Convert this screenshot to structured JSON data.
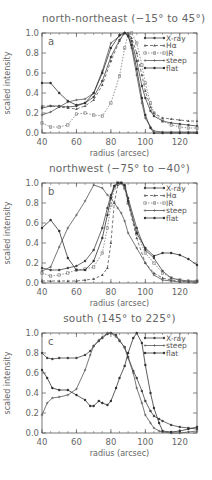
{
  "chart_data": [
    {
      "type": "line",
      "panel_label": "a",
      "title": "north-northeast (−15° to 45°)",
      "xlabel": "radius (arcsec)",
      "ylabel": "scaled intensity",
      "xlim": [
        40,
        130
      ],
      "ylim": [
        0,
        1.0
      ],
      "xticks": [
        40,
        60,
        80,
        100,
        120
      ],
      "yticks": [
        0.0,
        0.2,
        0.4,
        0.6,
        0.8,
        1.0
      ],
      "grid": false,
      "legend_position": "upper right",
      "x": [
        40,
        45,
        50,
        55,
        60,
        65,
        70,
        75,
        80,
        85,
        88,
        90,
        92,
        95,
        98,
        100,
        103,
        105,
        110,
        115,
        120,
        125,
        130
      ],
      "series": [
        {
          "name": "X-ray",
          "marker": "filled-circle",
          "values": [
            0.25,
            0.27,
            0.27,
            0.26,
            0.27,
            0.3,
            0.36,
            0.52,
            0.76,
            0.93,
            1.0,
            0.99,
            0.92,
            0.72,
            0.47,
            0.35,
            0.22,
            0.17,
            0.12,
            0.1,
            0.09,
            0.08,
            0.07
          ]
        },
        {
          "name": "Hα",
          "marker": "triangle",
          "values": [
            0.27,
            0.27,
            0.26,
            0.25,
            0.24,
            0.27,
            0.33,
            0.48,
            0.72,
            0.92,
            1.0,
            1.0,
            0.95,
            0.8,
            0.58,
            0.42,
            0.26,
            0.2,
            0.15,
            0.14,
            0.13,
            0.12,
            0.12
          ]
        },
        {
          "name": "IR",
          "marker": "open-square",
          "values": [
            0.1,
            0.06,
            0.06,
            0.08,
            0.19,
            0.2,
            0.18,
            0.17,
            0.3,
            0.57,
            0.85,
            0.99,
            1.0,
            0.9,
            0.68,
            0.5,
            0.3,
            0.2,
            0.12,
            0.08,
            0.06,
            0.05,
            0.05
          ]
        },
        {
          "name": "steep",
          "marker": "plus",
          "values": [
            0.18,
            0.21,
            0.26,
            0.31,
            0.33,
            0.34,
            0.4,
            0.62,
            0.9,
            0.97,
            1.0,
            0.97,
            0.85,
            0.58,
            0.3,
            0.15,
            0.06,
            0.02,
            0.01,
            0.01,
            0.01,
            0.01,
            0.01
          ]
        },
        {
          "name": "flat",
          "marker": "filled-circle",
          "values": [
            0.5,
            0.5,
            0.4,
            0.32,
            0.28,
            0.3,
            0.4,
            0.6,
            0.85,
            0.98,
            1.0,
            0.97,
            0.88,
            0.64,
            0.35,
            0.18,
            0.05,
            0.0,
            0.0,
            0.0,
            0.0,
            0.0,
            0.0
          ]
        }
      ]
    },
    {
      "type": "line",
      "panel_label": "b",
      "title": "northwest (−75° to −40°)",
      "xlabel": "radius (arcsec)",
      "ylabel": "scaled intensity",
      "xlim": [
        40,
        130
      ],
      "ylim": [
        0,
        1.0
      ],
      "xticks": [
        40,
        60,
        80,
        100,
        120
      ],
      "yticks": [
        0.0,
        0.2,
        0.4,
        0.6,
        0.8,
        1.0
      ],
      "grid": false,
      "legend_position": "upper right",
      "x": [
        40,
        45,
        50,
        55,
        60,
        65,
        70,
        75,
        78,
        80,
        82,
        84,
        86,
        88,
        90,
        95,
        100,
        105,
        110,
        115,
        120,
        125,
        130
      ],
      "series": [
        {
          "name": "X-ray",
          "marker": "filled-circle",
          "values": [
            0.15,
            0.13,
            0.13,
            0.15,
            0.17,
            0.22,
            0.33,
            0.55,
            0.75,
            0.88,
            0.97,
            1.0,
            1.0,
            0.97,
            0.85,
            0.55,
            0.33,
            0.25,
            0.12,
            0.05,
            0.03,
            0.02,
            0.02
          ]
        },
        {
          "name": "Hα",
          "marker": "triangle",
          "values": [
            0.02,
            0.02,
            0.02,
            0.02,
            0.02,
            0.03,
            0.04,
            0.08,
            0.15,
            0.4,
            0.8,
            0.98,
            1.0,
            0.95,
            0.8,
            0.45,
            0.2,
            0.1,
            0.05,
            0.03,
            0.02,
            0.01,
            0.01
          ]
        },
        {
          "name": "IR",
          "marker": "open-square",
          "values": [
            0.1,
            0.07,
            0.08,
            0.1,
            0.13,
            0.14,
            0.16,
            0.3,
            0.55,
            0.78,
            0.95,
            1.0,
            1.0,
            0.95,
            0.8,
            0.5,
            0.3,
            0.2,
            0.1,
            0.05,
            0.03,
            0.02,
            0.02
          ]
        },
        {
          "name": "steep",
          "marker": "plus",
          "values": [
            0.12,
            0.16,
            0.36,
            0.55,
            0.68,
            0.82,
            0.98,
            0.95,
            0.88,
            0.85,
            0.8,
            0.75,
            0.7,
            0.62,
            0.5,
            0.35,
            0.2,
            0.08,
            0.03,
            0.02,
            0.01,
            0.01,
            0.01
          ]
        },
        {
          "name": "flat",
          "marker": "filled-circle",
          "values": [
            0.55,
            0.63,
            0.52,
            0.25,
            0.13,
            0.13,
            0.22,
            0.45,
            0.68,
            0.85,
            0.97,
            1.0,
            1.0,
            0.98,
            0.82,
            0.5,
            0.35,
            0.27,
            0.3,
            0.3,
            0.28,
            0.24,
            0.18
          ]
        }
      ]
    },
    {
      "type": "line",
      "panel_label": "c",
      "title": "south (145° to 225°)",
      "xlabel": "radius (arcsec)",
      "ylabel": "scaled intensity",
      "xlim": [
        40,
        130
      ],
      "ylim": [
        0,
        1.0
      ],
      "xticks": [
        40,
        60,
        80,
        100,
        120
      ],
      "yticks": [
        0.0,
        0.2,
        0.4,
        0.6,
        0.8,
        1.0
      ],
      "grid": false,
      "legend_position": "upper right",
      "x": [
        40,
        43,
        46,
        50,
        55,
        60,
        65,
        68,
        70,
        73,
        75,
        78,
        80,
        83,
        85,
        88,
        90,
        93,
        95,
        98,
        100,
        103,
        105,
        108,
        110,
        115,
        120,
        125,
        130
      ],
      "series": [
        {
          "name": "X-ray",
          "marker": "filled-circle",
          "values": [
            0.8,
            0.75,
            0.74,
            0.75,
            0.75,
            0.75,
            0.78,
            0.82,
            0.87,
            0.92,
            0.95,
            0.99,
            1.0,
            0.98,
            0.92,
            0.86,
            0.76,
            0.62,
            0.55,
            0.42,
            0.32,
            0.22,
            0.17,
            0.14,
            0.12,
            0.08,
            0.06,
            0.05,
            0.04
          ]
        },
        {
          "name": "steep",
          "marker": "plus",
          "values": [
            0.18,
            0.3,
            0.35,
            0.36,
            0.38,
            0.44,
            0.63,
            0.78,
            0.87,
            0.93,
            0.96,
            1.0,
            1.0,
            0.96,
            0.93,
            0.85,
            0.75,
            0.6,
            0.45,
            0.3,
            0.18,
            0.1,
            0.05,
            0.02,
            0.01,
            0.0,
            0.0,
            0.01,
            0.02
          ]
        },
        {
          "name": "flat",
          "marker": "filled-circle",
          "values": [
            0.63,
            0.55,
            0.45,
            0.43,
            0.43,
            0.38,
            0.33,
            0.27,
            0.27,
            0.32,
            0.3,
            0.28,
            0.32,
            0.45,
            0.55,
            0.67,
            0.8,
            0.95,
            1.0,
            0.9,
            0.68,
            0.4,
            0.25,
            0.1,
            0.02,
            0.01,
            0.02,
            0.04,
            0.06
          ]
        }
      ]
    }
  ]
}
